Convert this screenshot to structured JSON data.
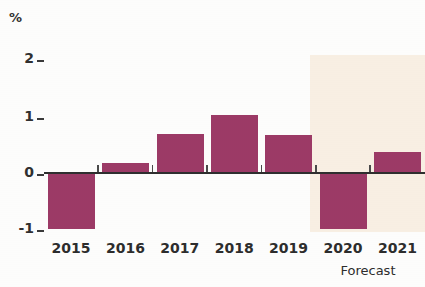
{
  "chart_data": {
    "type": "bar",
    "title": "",
    "subtitle": "",
    "xlabel": "",
    "ylabel": "%",
    "unit_label": "%",
    "categories": [
      "2015",
      "2016",
      "2017",
      "2018",
      "2019",
      "2020",
      "2021"
    ],
    "values": [
      -1.0,
      0.15,
      0.67,
      1.0,
      0.65,
      -1.0,
      0.35
    ],
    "series": [
      {
        "name": "",
        "values": [
          -1.0,
          0.15,
          0.67,
          1.0,
          0.65,
          -1.0,
          0.35
        ]
      }
    ],
    "ylim": [
      -1.2,
      2.2
    ],
    "yticks": [
      2,
      1,
      0,
      -1
    ],
    "ytick_labels": [
      "2",
      "1",
      "0",
      "-1"
    ],
    "grid": false,
    "legend": null,
    "bar_color": "#9c3a66",
    "zero_line_color": "#2f2f2f",
    "annotations": [
      {
        "name": "forecast-band",
        "label": "Forecast",
        "covers_categories": [
          "2020",
          "2021"
        ],
        "shading_color": "#f8efe3"
      }
    ]
  },
  "axis": {
    "unit": "%",
    "y_tick_2": "2",
    "y_tick_1": "1",
    "y_tick_0": "0",
    "y_tick_neg1": "-1"
  },
  "xaxis": {
    "labels": [
      "2015",
      "2016",
      "2017",
      "2018",
      "2019",
      "2020",
      "2021"
    ]
  },
  "forecast": {
    "caption": "Forecast"
  }
}
